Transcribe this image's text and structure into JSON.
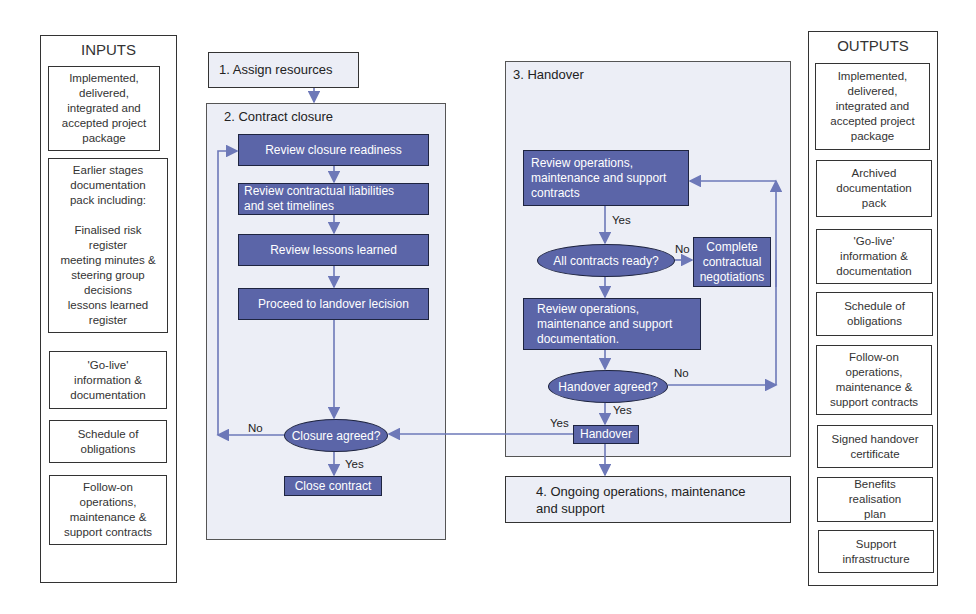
{
  "inputs": {
    "title": "INPUTS",
    "items": [
      "Implemented,\ndelivered,\nintegrated and\naccepted project\npackage",
      "Earlier stages\ndocumentation\npack including:\n\nFinalised risk\nregister\nmeeting minutes &\nsteering group\ndecisions\nlessons learned\nregister",
      "'Go-live'\ninformation &\ndocumentation",
      "Schedule of\nobligations",
      "Follow-on\noperations,\nmaintenance &\nsupport contracts"
    ]
  },
  "outputs": {
    "title": "OUTPUTS",
    "items": [
      "Implemented,\ndelivered,\nintegrated and\naccepted project\npackage",
      "Archived\ndocumentation\npack",
      "'Go-live'\ninformation &\ndocumentation",
      "Schedule of\nobligations",
      "Follow-on\noperations,\nmaintenance &\nsupport contracts",
      "Signed handover\ncertificate",
      "Benefits\nrealisation\nplan",
      "Support\ninfrastructure"
    ]
  },
  "step1": "1. Assign resources",
  "contract_closure": {
    "title": "2. Contract closure",
    "steps": [
      "Review closure readiness",
      "Review contractual liabilities\nand set timelines",
      "Review lessons learned",
      "Proceed to landover lecision"
    ],
    "decision": "Closure agreed?",
    "no_label": "No",
    "yes_label": "Yes",
    "final": "Close contract"
  },
  "handover": {
    "title": "3. Handover",
    "review_contracts": "Review operations,\nmaintenance and support\ncontracts",
    "yes_label_1": "Yes",
    "decision_contracts": "All contracts ready?",
    "no_label_1": "No",
    "complete_negotiations": "Complete\ncontractual\nnegotiations",
    "review_docs": "Review operations,\nmaintenance and support\ndocumentation.",
    "decision_handover": "Handover agreed?",
    "no_label_2": "No",
    "yes_label_2": "Yes",
    "yes_label_3": "Yes",
    "handover_box": "Handover"
  },
  "step4": "4. Ongoing operations, maintenance\nand support",
  "colors": {
    "process_fill": "#5b65a8",
    "panel_fill": "#eceef6",
    "arrow": "#6d78b8"
  }
}
